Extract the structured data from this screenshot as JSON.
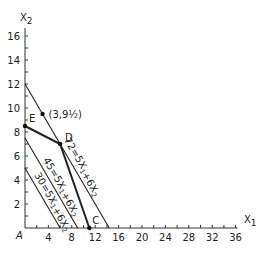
{
  "chart_data": {
    "type": "line",
    "title": "",
    "xlabel": "X1",
    "ylabel": "X2",
    "xlim": [
      0,
      36
    ],
    "ylim": [
      0,
      16
    ],
    "x_ticks": [
      4,
      8,
      12,
      16,
      20,
      24,
      28,
      32,
      36
    ],
    "y_ticks": [
      2,
      4,
      6,
      8,
      10,
      12,
      14,
      16
    ],
    "origin_label": "A",
    "series": [
      {
        "name": "72 = 5X1 + 6X2",
        "label": "72=5X1+6X2",
        "points": [
          [
            0,
            12
          ],
          [
            14.4,
            0
          ]
        ],
        "style": "thin"
      },
      {
        "name": "45 = 5X1 + 6X2",
        "label": "45=5X1+6X2",
        "points": [
          [
            0,
            7.5
          ],
          [
            9,
            0
          ]
        ],
        "style": "thin"
      },
      {
        "name": "30 = 5X1 + 6X2",
        "label": "30=5X1+6X2",
        "points": [
          [
            0,
            5
          ],
          [
            6,
            0
          ]
        ],
        "style": "thin"
      },
      {
        "name": "constraint boundary E-D-C",
        "points": [
          [
            0,
            8.5
          ],
          [
            6,
            7
          ],
          [
            11,
            0
          ]
        ],
        "style": "bold"
      }
    ],
    "annotations": [
      {
        "text": "(3,9½)",
        "point": [
          3,
          9.5
        ]
      },
      {
        "text": "E",
        "point": [
          0,
          8.5
        ]
      },
      {
        "text": "D",
        "point": [
          6,
          7
        ]
      },
      {
        "text": "C",
        "point": [
          11,
          0
        ]
      }
    ]
  },
  "axes": {
    "x_label": "X",
    "x_sub": "1",
    "y_label": "X",
    "y_sub": "2",
    "origin": "A"
  }
}
